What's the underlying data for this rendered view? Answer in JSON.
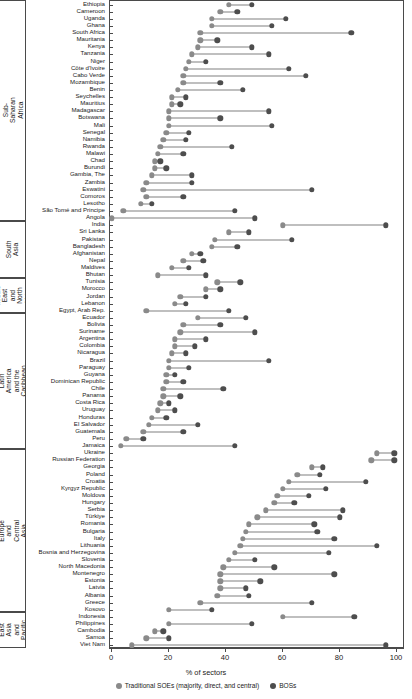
{
  "chart_data": {
    "type": "scatter",
    "subtype": "dumbbell",
    "title": "",
    "xlabel": "% of sectors",
    "ylabel": "",
    "xlim": [
      0,
      100
    ],
    "xticks": [
      0,
      20,
      40,
      60,
      80,
      100
    ],
    "grid": false,
    "legend_position": "bottom",
    "series": [
      {
        "name": "Traditional SOEs (majority, direct, and central)",
        "color": "#8a8a8a",
        "key": "soe"
      },
      {
        "name": "BOSs",
        "color": "#4d4d4d",
        "key": "bos"
      }
    ],
    "regions": [
      {
        "name": "Sub-Saharan Africa",
        "countries": [
          {
            "label": "Ethiopia",
            "soe": 41,
            "bos": 49
          },
          {
            "label": "Cameroon",
            "soe": 38,
            "bos": 44
          },
          {
            "label": "Uganda",
            "soe": 35,
            "bos": 61
          },
          {
            "label": "Ghana",
            "soe": 35,
            "bos": 56
          },
          {
            "label": "South Africa",
            "soe": 31,
            "bos": 84
          },
          {
            "label": "Mauritania",
            "soe": 31,
            "bos": 37
          },
          {
            "label": "Kenya",
            "soe": 30,
            "bos": 49
          },
          {
            "label": "Tanzania",
            "soe": 28,
            "bos": 55
          },
          {
            "label": "Niger",
            "soe": 27,
            "bos": 33
          },
          {
            "label": "Côte d'Ivoire",
            "soe": 26,
            "bos": 62
          },
          {
            "label": "Cabo Verde",
            "soe": 25,
            "bos": 68
          },
          {
            "label": "Mozambique",
            "soe": 25,
            "bos": 38
          },
          {
            "label": "Benin",
            "soe": 23,
            "bos": 46
          },
          {
            "label": "Seychelles",
            "soe": 21,
            "bos": 26
          },
          {
            "label": "Mauritius",
            "soe": 21,
            "bos": 24
          },
          {
            "label": "Madagascar",
            "soe": 20,
            "bos": 55
          },
          {
            "label": "Botswana",
            "soe": 20,
            "bos": 38
          },
          {
            "label": "Mali",
            "soe": 20,
            "bos": 56
          },
          {
            "label": "Senegal",
            "soe": 19,
            "bos": 27
          },
          {
            "label": "Namibia",
            "soe": 18,
            "bos": 26
          },
          {
            "label": "Rwanda",
            "soe": 17,
            "bos": 42
          },
          {
            "label": "Malawi",
            "soe": 16,
            "bos": 25
          },
          {
            "label": "Chad",
            "soe": 15,
            "bos": 17
          },
          {
            "label": "Burundi",
            "soe": 15,
            "bos": 19
          },
          {
            "label": "Gambia, The",
            "soe": 14,
            "bos": 28
          },
          {
            "label": "Zambia",
            "soe": 12,
            "bos": 28
          },
          {
            "label": "Eswatini",
            "soe": 11,
            "bos": 70
          },
          {
            "label": "Comoros",
            "soe": 12,
            "bos": 25
          },
          {
            "label": "Lesotho",
            "soe": 10,
            "bos": 14
          },
          {
            "label": "São Tomé and Principe",
            "soe": 4,
            "bos": 43
          },
          {
            "label": "Angola",
            "soe": 0,
            "bos": 50
          }
        ]
      },
      {
        "name": "South Asia",
        "countries": [
          {
            "label": "India",
            "soe": 60,
            "bos": 96
          },
          {
            "label": "Sri Lanka",
            "soe": 41,
            "bos": 48
          },
          {
            "label": "Pakistan",
            "soe": 36,
            "bos": 63
          },
          {
            "label": "Bangladesh",
            "soe": 35,
            "bos": 44
          },
          {
            "label": "Afghanistan",
            "soe": 28,
            "bos": 31
          },
          {
            "label": "Nepal",
            "soe": 25,
            "bos": 32
          },
          {
            "label": "Maldives",
            "soe": 21,
            "bos": 27
          },
          {
            "label": "Bhutan",
            "soe": 16,
            "bos": 33
          }
        ]
      },
      {
        "name": "Middle East and North Africa",
        "countries": [
          {
            "label": "Tunisia",
            "soe": 37,
            "bos": 45
          },
          {
            "label": "Morocco",
            "soe": 33,
            "bos": 38
          },
          {
            "label": "Jordan",
            "soe": 24,
            "bos": 33
          },
          {
            "label": "Lebanon",
            "soe": 22,
            "bos": 26
          },
          {
            "label": "Egypt, Arab Rep.",
            "soe": 12,
            "bos": 41
          }
        ]
      },
      {
        "name": "Latin America and the Caribbean",
        "countries": [
          {
            "label": "Ecuador",
            "soe": 30,
            "bos": 47
          },
          {
            "label": "Bolivia",
            "soe": 25,
            "bos": 38
          },
          {
            "label": "Suriname",
            "soe": 24,
            "bos": 50
          },
          {
            "label": "Argentina",
            "soe": 22,
            "bos": 33
          },
          {
            "label": "Colombia",
            "soe": 22,
            "bos": 29
          },
          {
            "label": "Nicaragua",
            "soe": 21,
            "bos": 26
          },
          {
            "label": "Brazil",
            "soe": 20,
            "bos": 55
          },
          {
            "label": "Paraguay",
            "soe": 20,
            "bos": 27
          },
          {
            "label": "Guyana",
            "soe": 19,
            "bos": 22
          },
          {
            "label": "Dominican Republic",
            "soe": 19,
            "bos": 25
          },
          {
            "label": "Chile",
            "soe": 18,
            "bos": 39
          },
          {
            "label": "Panama",
            "soe": 18,
            "bos": 24
          },
          {
            "label": "Costa Rica",
            "soe": 17,
            "bos": 20
          },
          {
            "label": "Uruguay",
            "soe": 16,
            "bos": 22
          },
          {
            "label": "Honduras",
            "soe": 14,
            "bos": 19
          },
          {
            "label": "El Salvador",
            "soe": 13,
            "bos": 30
          },
          {
            "label": "Guatemala",
            "soe": 11,
            "bos": 25
          },
          {
            "label": "Peru",
            "soe": 5,
            "bos": 11
          },
          {
            "label": "Jamaica",
            "soe": 3,
            "bos": 43
          }
        ]
      },
      {
        "name": "Europe and Central Asia",
        "countries": [
          {
            "label": "Ukraine",
            "soe": 93,
            "bos": 99
          },
          {
            "label": "Russian Federation",
            "soe": 91,
            "bos": 99
          },
          {
            "label": "Georgia",
            "soe": 70,
            "bos": 74
          },
          {
            "label": "Poland",
            "soe": 65,
            "bos": 73
          },
          {
            "label": "Croatia",
            "soe": 62,
            "bos": 89
          },
          {
            "label": "Kyrgyz Republic",
            "soe": 60,
            "bos": 75
          },
          {
            "label": "Moldova",
            "soe": 58,
            "bos": 69
          },
          {
            "label": "Hungary",
            "soe": 57,
            "bos": 64
          },
          {
            "label": "Serbia",
            "soe": 54,
            "bos": 81
          },
          {
            "label": "Türkiye",
            "soe": 51,
            "bos": 80
          },
          {
            "label": "Romania",
            "soe": 48,
            "bos": 71
          },
          {
            "label": "Bulgaria",
            "soe": 47,
            "bos": 72
          },
          {
            "label": "Italy",
            "soe": 46,
            "bos": 78
          },
          {
            "label": "Lithuania",
            "soe": 45,
            "bos": 93
          },
          {
            "label": "Bosnia and Herzegovina",
            "soe": 43,
            "bos": 76
          },
          {
            "label": "Slovenia",
            "soe": 41,
            "bos": 50
          },
          {
            "label": "North Macedonia",
            "soe": 39,
            "bos": 57
          },
          {
            "label": "Montenegro",
            "soe": 38,
            "bos": 78
          },
          {
            "label": "Estonia",
            "soe": 38,
            "bos": 52
          },
          {
            "label": "Latvia",
            "soe": 38,
            "bos": 47
          },
          {
            "label": "Albania",
            "soe": 37,
            "bos": 48
          },
          {
            "label": "Greece",
            "soe": 31,
            "bos": 70
          },
          {
            "label": "Kosovo",
            "soe": 20,
            "bos": 35
          }
        ]
      },
      {
        "name": "East Asia and Pacific",
        "countries": [
          {
            "label": "Indonesia",
            "soe": 60,
            "bos": 85
          },
          {
            "label": "Philippines",
            "soe": 20,
            "bos": 49
          },
          {
            "label": "Cambodia",
            "soe": 15,
            "bos": 18
          },
          {
            "label": "Samoa",
            "soe": 12,
            "bos": 20
          },
          {
            "label": "Viet Nam",
            "soe": 7,
            "bos": 96
          }
        ]
      }
    ]
  }
}
